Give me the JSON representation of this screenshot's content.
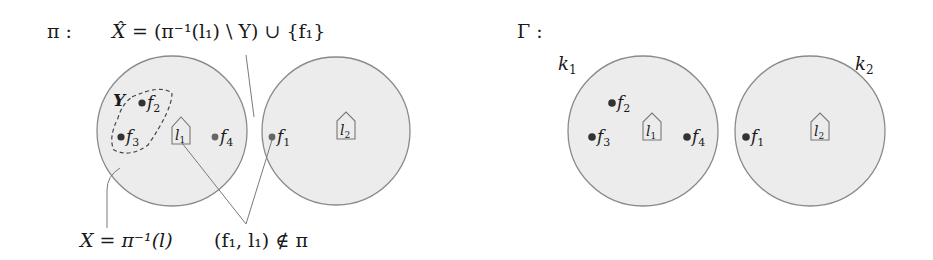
{
  "left_panel": {
    "label": "π :",
    "top_annotation": {
      "xhat": "X̂",
      "rest": "= (π⁻¹(l₁) \\ Y) ∪ {f₁}"
    },
    "subset_label": "Y",
    "bottom_left_annotation": "X = π⁻¹(l)",
    "bottom_right_annotation": "(f₁, l₁) ∉ π",
    "circles": [
      {
        "id": "pi-cluster-1",
        "location": {
          "label": "l",
          "sub": "1"
        },
        "points": [
          {
            "label": "f",
            "sub": "2"
          },
          {
            "label": "f",
            "sub": "3"
          },
          {
            "label": "f",
            "sub": "4"
          }
        ]
      },
      {
        "id": "pi-cluster-2",
        "location": {
          "label": "l",
          "sub": "2"
        },
        "points": [
          {
            "label": "f",
            "sub": "1"
          }
        ]
      }
    ]
  },
  "right_panel": {
    "label": "Γ :",
    "circles": [
      {
        "id": "k1",
        "name": "k",
        "name_sub": "1",
        "location": {
          "label": "l",
          "sub": "1"
        },
        "points": [
          {
            "label": "f",
            "sub": "2"
          },
          {
            "label": "f",
            "sub": "3"
          },
          {
            "label": "f",
            "sub": "4"
          }
        ]
      },
      {
        "id": "k2",
        "name": "k",
        "name_sub": "2",
        "location": {
          "label": "l",
          "sub": "2"
        },
        "points": [
          {
            "label": "f",
            "sub": "1"
          }
        ]
      }
    ]
  },
  "colors": {
    "circle_fill": "#ececec",
    "circle_stroke": "#8a8a8a",
    "text": "#1a1a1a",
    "point": "#333333"
  }
}
